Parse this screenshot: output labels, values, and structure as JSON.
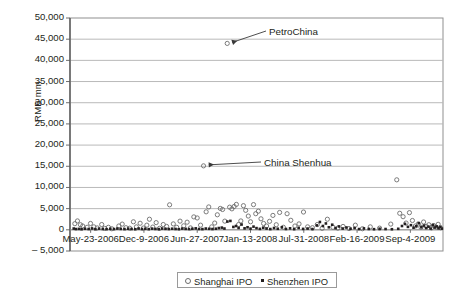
{
  "chart_data": {
    "type": "scatter",
    "title": "",
    "xlabel": "",
    "ylabel": "RMB mm",
    "ylim": [
      -5000,
      50000
    ],
    "ytick_labels": [
      "50,000",
      "45,000",
      "40,000",
      "35,000",
      "30,000",
      "25,000",
      "20,000",
      "15,000",
      "10,000",
      "5,000",
      "0",
      "– 5,000"
    ],
    "ytick_values": [
      50000,
      45000,
      40000,
      35000,
      30000,
      25000,
      20000,
      15000,
      10000,
      5000,
      0,
      -5000
    ],
    "xtick_labels": [
      "May-23-2006",
      "Dec-9-2006",
      "Jun-27-2007",
      "Jan-13-2008",
      "Jul-31-2008",
      "Feb-16-2009",
      "Sep-4-2009"
    ],
    "grid": "horizontal",
    "legend_position": "bottom-center",
    "legend": [
      {
        "name": "Shanghai IPO",
        "marker": "open-circle",
        "color": "#6d6d6d"
      },
      {
        "name": "Shenzhen IPO",
        "marker": "filled-square",
        "color": "#231f20"
      }
    ],
    "annotations": [
      {
        "label": "PetroChina",
        "point_x": 0.4215,
        "point_y": 44000
      },
      {
        "label": "China Shenhua",
        "point_x": 0.3585,
        "point_y": 15100
      }
    ],
    "series": [
      {
        "name": "Shanghai IPO",
        "marker": "open-circle",
        "points": [
          [
            0.013,
            1450
          ],
          [
            0.02,
            2100
          ],
          [
            0.028,
            1200
          ],
          [
            0.034,
            900
          ],
          [
            0.046,
            600
          ],
          [
            0.055,
            1500
          ],
          [
            0.064,
            700
          ],
          [
            0.073,
            450
          ],
          [
            0.085,
            1250
          ],
          [
            0.093,
            350
          ],
          [
            0.103,
            600
          ],
          [
            0.112,
            250
          ],
          [
            0.131,
            900
          ],
          [
            0.14,
            1350
          ],
          [
            0.15,
            500
          ],
          [
            0.16,
            380
          ],
          [
            0.17,
            1900
          ],
          [
            0.178,
            700
          ],
          [
            0.188,
            1550
          ],
          [
            0.197,
            420
          ],
          [
            0.206,
            1100
          ],
          [
            0.213,
            2500
          ],
          [
            0.222,
            650
          ],
          [
            0.231,
            1700
          ],
          [
            0.24,
            350
          ],
          [
            0.25,
            1250
          ],
          [
            0.259,
            800
          ],
          [
            0.267,
            5900
          ],
          [
            0.277,
            1400
          ],
          [
            0.286,
            600
          ],
          [
            0.295,
            2050
          ],
          [
            0.305,
            950
          ],
          [
            0.314,
            1800
          ],
          [
            0.323,
            450
          ],
          [
            0.332,
            3050
          ],
          [
            0.341,
            2800
          ],
          [
            0.35,
            1100
          ],
          [
            0.358,
            15100
          ],
          [
            0.365,
            4250
          ],
          [
            0.372,
            5400
          ],
          [
            0.38,
            700
          ],
          [
            0.388,
            1600
          ],
          [
            0.395,
            3550
          ],
          [
            0.403,
            5050
          ],
          [
            0.409,
            4800
          ],
          [
            0.415,
            2050
          ],
          [
            0.4215,
            44000
          ],
          [
            0.428,
            5350
          ],
          [
            0.434,
            4950
          ],
          [
            0.44,
            5500
          ],
          [
            0.446,
            6000
          ],
          [
            0.452,
            1250
          ],
          [
            0.458,
            2100
          ],
          [
            0.465,
            5700
          ],
          [
            0.471,
            4600
          ],
          [
            0.478,
            3250
          ],
          [
            0.484,
            1900
          ],
          [
            0.492,
            5950
          ],
          [
            0.498,
            3800
          ],
          [
            0.505,
            4400
          ],
          [
            0.512,
            2600
          ],
          [
            0.519,
            1500
          ],
          [
            0.527,
            900
          ],
          [
            0.535,
            2000
          ],
          [
            0.544,
            3400
          ],
          [
            0.553,
            1200
          ],
          [
            0.562,
            4100
          ],
          [
            0.572,
            600
          ],
          [
            0.582,
            3800
          ],
          [
            0.592,
            2250
          ],
          [
            0.603,
            900
          ],
          [
            0.614,
            1400
          ],
          [
            0.626,
            4200
          ],
          [
            0.637,
            700
          ],
          [
            0.65,
            500
          ],
          [
            0.663,
            1250
          ],
          [
            0.676,
            350
          ],
          [
            0.69,
            2500
          ],
          [
            0.705,
            600
          ],
          [
            0.718,
            400
          ],
          [
            0.732,
            800
          ],
          [
            0.748,
            300
          ],
          [
            0.765,
            1100
          ],
          [
            0.784,
            250
          ],
          [
            0.805,
            700
          ],
          [
            0.83,
            400
          ],
          [
            0.86,
            1350
          ],
          [
            0.876,
            11800
          ],
          [
            0.884,
            3900
          ],
          [
            0.893,
            3100
          ],
          [
            0.901,
            1600
          ],
          [
            0.91,
            4050
          ],
          [
            0.918,
            2200
          ],
          [
            0.926,
            900
          ],
          [
            0.934,
            1400
          ],
          [
            0.941,
            600
          ],
          [
            0.948,
            1850
          ],
          [
            0.955,
            800
          ],
          [
            0.962,
            1200
          ],
          [
            0.969,
            450
          ],
          [
            0.975,
            1000
          ],
          [
            0.981,
            650
          ],
          [
            0.987,
            1300
          ],
          [
            0.993,
            500
          ]
        ]
      },
      {
        "name": "Shenzhen IPO",
        "marker": "filled-square",
        "points": [
          [
            0.01,
            300
          ],
          [
            0.016,
            180
          ],
          [
            0.024,
            220
          ],
          [
            0.031,
            140
          ],
          [
            0.04,
            260
          ],
          [
            0.05,
            190
          ],
          [
            0.059,
            320
          ],
          [
            0.068,
            150
          ],
          [
            0.078,
            280
          ],
          [
            0.088,
            200
          ],
          [
            0.098,
            160
          ],
          [
            0.108,
            240
          ],
          [
            0.118,
            180
          ],
          [
            0.127,
            300
          ],
          [
            0.136,
            220
          ],
          [
            0.146,
            170
          ],
          [
            0.156,
            260
          ],
          [
            0.165,
            200
          ],
          [
            0.175,
            140
          ],
          [
            0.184,
            310
          ],
          [
            0.193,
            190
          ],
          [
            0.202,
            250
          ],
          [
            0.211,
            160
          ],
          [
            0.22,
            280
          ],
          [
            0.229,
            210
          ],
          [
            0.238,
            170
          ],
          [
            0.247,
            300
          ],
          [
            0.256,
            230
          ],
          [
            0.265,
            180
          ],
          [
            0.274,
            260
          ],
          [
            0.283,
            200
          ],
          [
            0.292,
            150
          ],
          [
            0.301,
            290
          ],
          [
            0.31,
            220
          ],
          [
            0.319,
            180
          ],
          [
            0.328,
            250
          ],
          [
            0.337,
            340
          ],
          [
            0.346,
            200
          ],
          [
            0.355,
            170
          ],
          [
            0.364,
            300
          ],
          [
            0.373,
            240
          ],
          [
            0.382,
            190
          ],
          [
            0.391,
            260
          ],
          [
            0.399,
            420
          ],
          [
            0.407,
            520
          ],
          [
            0.414,
            300
          ],
          [
            0.422,
            1950
          ],
          [
            0.43,
            2100
          ],
          [
            0.438,
            680
          ],
          [
            0.445,
            900
          ],
          [
            0.452,
            450
          ],
          [
            0.46,
            1250
          ],
          [
            0.468,
            350
          ],
          [
            0.476,
            600
          ],
          [
            0.484,
            280
          ],
          [
            0.492,
            750
          ],
          [
            0.5,
            400
          ],
          [
            0.509,
            220
          ],
          [
            0.518,
            500
          ],
          [
            0.527,
            300
          ],
          [
            0.537,
            180
          ],
          [
            0.547,
            420
          ],
          [
            0.557,
            250
          ],
          [
            0.568,
            600
          ],
          [
            0.579,
            200
          ],
          [
            0.59,
            350
          ],
          [
            0.601,
            160
          ],
          [
            0.613,
            450
          ],
          [
            0.625,
            220
          ],
          [
            0.637,
            300
          ],
          [
            0.65,
            180
          ],
          [
            0.662,
            1050
          ],
          [
            0.67,
            1850
          ],
          [
            0.678,
            900
          ],
          [
            0.686,
            1500
          ],
          [
            0.694,
            600
          ],
          [
            0.703,
            1200
          ],
          [
            0.712,
            400
          ],
          [
            0.721,
            800
          ],
          [
            0.731,
            300
          ],
          [
            0.741,
            550
          ],
          [
            0.752,
            250
          ],
          [
            0.763,
            420
          ],
          [
            0.775,
            180
          ],
          [
            0.788,
            330
          ],
          [
            0.801,
            200
          ],
          [
            0.815,
            150
          ],
          [
            0.83,
            260
          ],
          [
            0.846,
            190
          ],
          [
            0.863,
            140
          ],
          [
            0.88,
            240
          ],
          [
            0.89,
            900
          ],
          [
            0.898,
            1400
          ],
          [
            0.906,
            700
          ],
          [
            0.914,
            1100
          ],
          [
            0.921,
            500
          ],
          [
            0.928,
            850
          ],
          [
            0.935,
            1550
          ],
          [
            0.942,
            600
          ],
          [
            0.949,
            1000
          ],
          [
            0.955,
            420
          ],
          [
            0.961,
            750
          ],
          [
            0.967,
            300
          ],
          [
            0.973,
            1150
          ],
          [
            0.978,
            550
          ],
          [
            0.983,
            800
          ],
          [
            0.988,
            350
          ],
          [
            0.993,
            650
          ],
          [
            0.997,
            280
          ]
        ]
      }
    ]
  }
}
